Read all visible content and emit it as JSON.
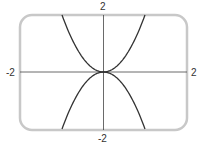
{
  "chart_data": {
    "type": "line",
    "title": "",
    "xlabel": "",
    "ylabel": "",
    "xlim": [
      -2,
      2
    ],
    "ylim": [
      -2,
      2
    ],
    "grid": false,
    "axis_labels": {
      "top": "2",
      "bottom": "-2",
      "left": "-2",
      "right": "2"
    },
    "series": [
      {
        "name": "y = 2x^2",
        "x": [
          -1,
          -0.5,
          0,
          0.5,
          1
        ],
        "values": [
          2,
          0.5,
          0,
          0.5,
          2
        ]
      },
      {
        "name": "y = -2x^2",
        "x": [
          -1,
          -0.5,
          0,
          0.5,
          1
        ],
        "values": [
          -2,
          -0.5,
          0,
          -0.5,
          -2
        ]
      }
    ],
    "colors": {
      "frame": "#c8c8c8",
      "curve": "#333333",
      "axes": "#444444"
    }
  }
}
